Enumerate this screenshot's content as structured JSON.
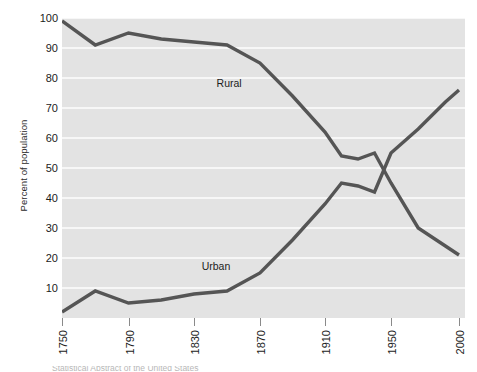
{
  "chart_data": {
    "type": "line",
    "title": "",
    "subtitle": "",
    "xlabel": "",
    "ylabel": "Percent of population",
    "xlim": [
      1750,
      2000
    ],
    "ylim": [
      0,
      100
    ],
    "grid": true,
    "legend_position": "inline-labels",
    "x_tick_labels": [
      "1750",
      "1790",
      "1830",
      "1870",
      "1910",
      "1950",
      "2000"
    ],
    "x_ticks": [
      1750,
      1790,
      1830,
      1870,
      1910,
      1950,
      2000
    ],
    "y_tick_labels": [
      "10",
      "20",
      "30",
      "40",
      "50",
      "60",
      "70",
      "80",
      "90",
      "100"
    ],
    "y_ticks": [
      10,
      20,
      30,
      40,
      50,
      60,
      70,
      80,
      90,
      100
    ],
    "series": [
      {
        "name": "Rural",
        "label": "Rural",
        "color": "#555555",
        "x": [
          1750,
          1770,
          1790,
          1810,
          1830,
          1850,
          1870,
          1890,
          1910,
          1920,
          1930,
          1940,
          1950,
          1970,
          1990,
          2000
        ],
        "values": [
          99,
          91,
          95,
          93,
          92,
          91,
          85,
          74,
          62,
          54,
          53,
          55,
          45,
          30,
          24,
          21
        ]
      },
      {
        "name": "Urban",
        "label": "Urban",
        "color": "#555555",
        "x": [
          1750,
          1770,
          1790,
          1810,
          1830,
          1850,
          1870,
          1890,
          1910,
          1920,
          1930,
          1940,
          1950,
          1970,
          1990,
          2000
        ],
        "values": [
          2,
          9,
          5,
          6,
          8,
          9,
          15,
          26,
          38,
          45,
          44,
          42,
          55,
          63,
          72,
          76
        ]
      }
    ],
    "annotations": [
      {
        "text": "Rural",
        "x": 1857,
        "y": 78
      },
      {
        "text": "Urban",
        "x": 1848,
        "y": 17
      }
    ]
  },
  "caption": {
    "text": "Statistical Abstract of the United States"
  }
}
